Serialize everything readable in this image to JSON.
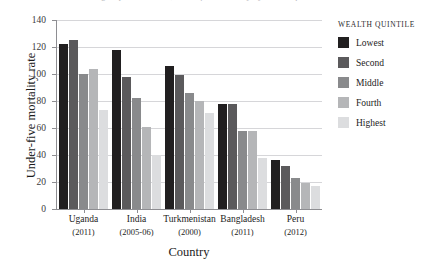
{
  "figure": {
    "cropped_title_sliver": "grouped bar chart, under-five mortality by wealth quintile"
  },
  "axes": {
    "ylabel": "Under-five mortality rate",
    "xlabel": "Country",
    "yticks": [
      0,
      20,
      40,
      60,
      80,
      100,
      120,
      140
    ]
  },
  "legend": {
    "title": "WEALTH QUINTILE",
    "items": [
      {
        "label": "Lowest",
        "color": "#211f20"
      },
      {
        "label": "Second",
        "color": "#5b5a5c"
      },
      {
        "label": "Middle",
        "color": "#898a8c"
      },
      {
        "label": "Fourth",
        "color": "#b5b6b8"
      },
      {
        "label": "Highest",
        "color": "#dcdddf"
      }
    ]
  },
  "chart_data": {
    "type": "bar",
    "title": "",
    "xlabel": "Country",
    "ylabel": "Under-five mortality rate",
    "ylim": [
      0,
      140
    ],
    "yticks": [
      0,
      20,
      40,
      60,
      80,
      100,
      120,
      140
    ],
    "grid": true,
    "legend_position": "right",
    "legend_title": "WEALTH QUINTILE",
    "categories": [
      "Uganda",
      "India",
      "Turkmenistan",
      "Bangladesh",
      "Peru"
    ],
    "category_years": [
      "(2011)",
      "(2005-06)",
      "(2000)",
      "(2011)",
      "(2012)"
    ],
    "series": [
      {
        "name": "Lowest",
        "color": "#211f20",
        "values": [
          122,
          118,
          106,
          78,
          36
        ]
      },
      {
        "name": "Second",
        "color": "#5b5a5c",
        "values": [
          125,
          98,
          99,
          78,
          32
        ]
      },
      {
        "name": "Middle",
        "color": "#898a8c",
        "values": [
          100,
          82,
          86,
          58,
          23
        ]
      },
      {
        "name": "Fourth",
        "color": "#b5b6b8",
        "values": [
          104,
          61,
          80,
          58,
          19
        ]
      },
      {
        "name": "Highest",
        "color": "#dcdddf",
        "values": [
          73,
          40,
          71,
          38,
          17
        ]
      }
    ]
  }
}
